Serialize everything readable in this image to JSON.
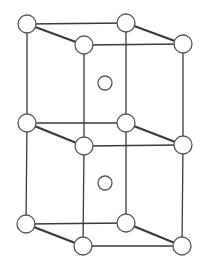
{
  "figure": {
    "kind": "crystal-structure",
    "canvas": {
      "width": 202,
      "height": 268,
      "background": "#ffffff"
    },
    "style": {
      "edge_color": "#3a3a3a",
      "edge_width_thin": 1.3,
      "edge_width_thick": 2.3,
      "atom_fill": "#ffffff",
      "atom_stroke": "#565656",
      "atom_stroke_width": 1.3,
      "corner_atom_radius": 9,
      "center_atom_radius": 7
    },
    "nodes": {
      "back-top-left": [
        27,
        24
      ],
      "back-top-right": [
        126,
        23
      ],
      "front-top-left": [
        84,
        45
      ],
      "front-top-right": [
        183,
        44
      ],
      "back-mid-left": [
        27,
        123
      ],
      "back-mid-right": [
        126,
        123
      ],
      "front-mid-left": [
        84,
        146
      ],
      "front-mid-right": [
        183,
        145
      ],
      "back-bottom-left": [
        26,
        224
      ],
      "back-bottom-right": [
        126,
        223
      ],
      "front-bottom-left": [
        83,
        246
      ],
      "front-bottom-right": [
        182,
        246
      ],
      "center-top-cell": [
        105,
        83
      ],
      "center-bottom-cell": [
        105,
        183
      ]
    },
    "edges": [
      {
        "from": "back-top-left",
        "to": "back-top-right",
        "weight": "thin"
      },
      {
        "from": "front-top-left",
        "to": "front-top-right",
        "weight": "thin"
      },
      {
        "from": "back-mid-left",
        "to": "back-mid-right",
        "weight": "thin"
      },
      {
        "from": "front-mid-left",
        "to": "front-mid-right",
        "weight": "thin"
      },
      {
        "from": "back-bottom-left",
        "to": "back-bottom-right",
        "weight": "thin"
      },
      {
        "from": "front-bottom-left",
        "to": "front-bottom-right",
        "weight": "thin"
      },
      {
        "from": "back-top-left",
        "to": "back-mid-left",
        "weight": "thin"
      },
      {
        "from": "back-mid-left",
        "to": "back-bottom-left",
        "weight": "thin"
      },
      {
        "from": "back-top-right",
        "to": "back-mid-right",
        "weight": "thin"
      },
      {
        "from": "back-mid-right",
        "to": "back-bottom-right",
        "weight": "thin"
      },
      {
        "from": "front-top-left",
        "to": "front-mid-left",
        "weight": "thin"
      },
      {
        "from": "front-mid-left",
        "to": "front-bottom-left",
        "weight": "thin"
      },
      {
        "from": "front-top-right",
        "to": "front-mid-right",
        "weight": "thin"
      },
      {
        "from": "front-mid-right",
        "to": "front-bottom-right",
        "weight": "thin"
      },
      {
        "from": "back-top-left",
        "to": "front-top-left",
        "weight": "thick"
      },
      {
        "from": "back-top-right",
        "to": "front-top-right",
        "weight": "thick"
      },
      {
        "from": "back-mid-left",
        "to": "front-mid-left",
        "weight": "thick"
      },
      {
        "from": "back-mid-right",
        "to": "front-mid-right",
        "weight": "thick"
      },
      {
        "from": "back-bottom-left",
        "to": "front-bottom-left",
        "weight": "thick"
      },
      {
        "from": "back-bottom-right",
        "to": "front-bottom-right",
        "weight": "thick"
      }
    ],
    "corner_atoms": [
      "back-top-left",
      "back-top-right",
      "front-top-left",
      "front-top-right",
      "back-mid-left",
      "back-mid-right",
      "front-mid-left",
      "front-mid-right",
      "back-bottom-left",
      "back-bottom-right",
      "front-bottom-left",
      "front-bottom-right"
    ],
    "center_atoms": [
      "center-top-cell",
      "center-bottom-cell"
    ]
  }
}
